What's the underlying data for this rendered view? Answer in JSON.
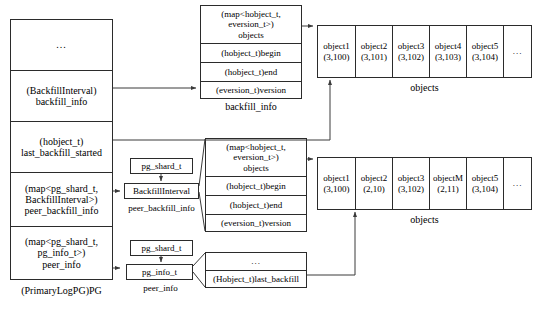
{
  "diagram": {
    "title_caption": "(PrimaryLogPG)PG",
    "accent_color": "#2b2b2b",
    "background": "#ffffff"
  },
  "pg_struct": {
    "name": "pg-struct",
    "caption": "(PrimaryLogPG)PG",
    "fields": [
      {
        "text": "...",
        "kind": "ellipsis"
      },
      {
        "text": "(BackfillInterval)\nbackfill_info",
        "kind": "field"
      },
      {
        "text": "(hobject_t)\nlast_backfill_started",
        "kind": "field"
      },
      {
        "text": "(map<pg_shard_t,\nBackfillInterval>)\npeer_backfill_info",
        "kind": "field"
      },
      {
        "text": "(map<pg_shard_t,\npg_info_t>)\npeer_info",
        "kind": "field"
      }
    ]
  },
  "backfill_info_struct": {
    "caption": "backfill_info",
    "fields": [
      "(map<hobject_t,\neversion_t>)\nobjects",
      "(hobject_t)begin",
      "(hobject_t)end",
      "(eversion_t)version"
    ]
  },
  "peer_backfill_info_struct": {
    "caption": "peer_backfill_info",
    "key_box": "pg_shard_t",
    "value_box": "BackfillInterval",
    "detail_fields": [
      "(map<hobject_t,\neversion_t>)\nobjects",
      "(hobject_t)begin",
      "(hobject_t)end",
      "(eversion_t)version"
    ]
  },
  "peer_info_struct": {
    "caption": "peer_info",
    "key_box": "pg_shard_t",
    "value_box": "pg_info_t",
    "detail_fields": [
      "...",
      "(Hobject_t)last_backfill"
    ]
  },
  "objects_table_top": {
    "caption": "objects",
    "cells": [
      {
        "name": "object1",
        "version": "(3,100)"
      },
      {
        "name": "object2",
        "version": "(3,101)"
      },
      {
        "name": "object3",
        "version": "(3,102)"
      },
      {
        "name": "object4",
        "version": "(3,103)"
      },
      {
        "name": "object5",
        "version": "(3,104)"
      },
      {
        "name": "...",
        "version": ""
      }
    ]
  },
  "objects_table_bottom": {
    "caption": "objects",
    "cells": [
      {
        "name": "object1",
        "version": "(3,100)"
      },
      {
        "name": "object2",
        "version": "(2,10)"
      },
      {
        "name": "object3",
        "version": "(3,102)"
      },
      {
        "name": "objectM",
        "version": "(2,11)"
      },
      {
        "name": "object5",
        "version": "(3,104)"
      },
      {
        "name": "...",
        "version": ""
      }
    ]
  }
}
